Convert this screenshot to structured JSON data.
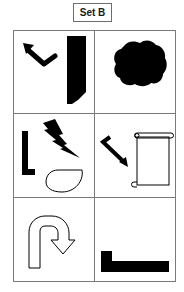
{
  "title": "Set B",
  "grid": {
    "rows": 3,
    "columns": 2,
    "cells": [
      {
        "row": 1,
        "col": 1,
        "items": [
          "bent-arrow-up-left",
          "black-vertical-bar-with-cut"
        ]
      },
      {
        "row": 1,
        "col": 2,
        "items": [
          "black-cloud-blob"
        ]
      },
      {
        "row": 2,
        "col": 1,
        "items": [
          "black-l-shape",
          "lightning-bolt",
          "outline-teardrop"
        ]
      },
      {
        "row": 2,
        "col": 2,
        "items": [
          "bent-arrow-down-right",
          "scroll-outline"
        ]
      },
      {
        "row": 3,
        "col": 1,
        "items": [
          "u-turn-arrow-outline"
        ]
      },
      {
        "row": 3,
        "col": 2,
        "items": [
          "black-stepped-bar"
        ]
      }
    ]
  },
  "colors": {
    "ink": "#000000",
    "border": "#7a7a7a",
    "background": "#ffffff"
  }
}
